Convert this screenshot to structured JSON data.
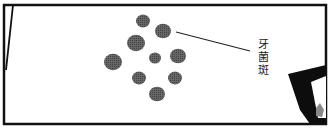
{
  "illustration": {
    "label": "牙菌斑",
    "label_chars": [
      "牙",
      "菌",
      "斑"
    ],
    "colors": {
      "frame": "#111111",
      "plaque": "#5a5a5a",
      "background": "#ffffff",
      "leader_line": "#222222"
    },
    "plaque_spots": [
      {
        "cx": 143,
        "cy": 21,
        "r": 7
      },
      {
        "cx": 163,
        "cy": 31,
        "r": 8
      },
      {
        "cx": 136,
        "cy": 43,
        "r": 9
      },
      {
        "cx": 113,
        "cy": 62,
        "r": 9
      },
      {
        "cx": 155,
        "cy": 58,
        "r": 6
      },
      {
        "cx": 178,
        "cy": 56,
        "r": 8
      },
      {
        "cx": 139,
        "cy": 78,
        "r": 7
      },
      {
        "cx": 175,
        "cy": 78,
        "r": 7
      },
      {
        "cx": 157,
        "cy": 94,
        "r": 8
      }
    ]
  }
}
